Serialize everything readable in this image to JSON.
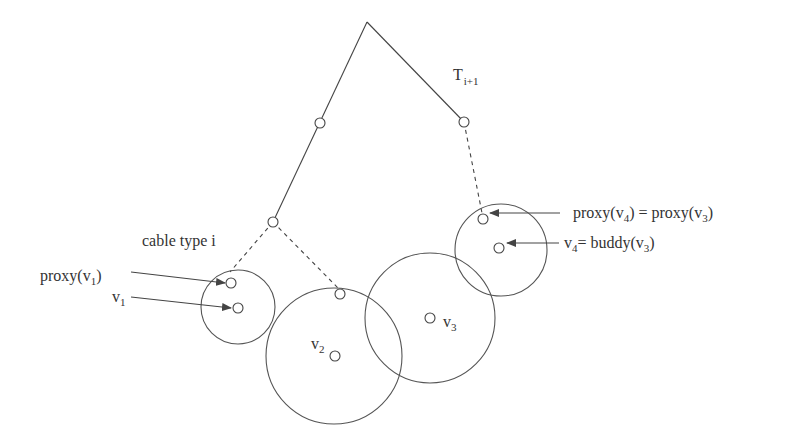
{
  "diagram": {
    "tree_label": {
      "main": "T",
      "sub": "i+1"
    },
    "edge_label": "cable type i",
    "labels": {
      "proxy_v1": {
        "pre": "proxy(v",
        "sub": "1",
        "post": ")"
      },
      "v1": {
        "pre": "v",
        "sub": "1"
      },
      "v2": {
        "pre": "v",
        "sub": "2"
      },
      "v3": {
        "pre": "v",
        "sub": "3"
      },
      "proxy_v4": {
        "pre1": "proxy(v",
        "sub1": "4",
        "mid": ") = proxy(v",
        "sub2": "3",
        "post": ")"
      },
      "v4_buddy": {
        "pre": "v",
        "sub1": "4",
        "mid": "= buddy(v",
        "sub2": "3",
        "post": ")"
      }
    },
    "colors": {
      "stroke": "#444444",
      "text": "#333333",
      "background": "#ffffff"
    }
  }
}
